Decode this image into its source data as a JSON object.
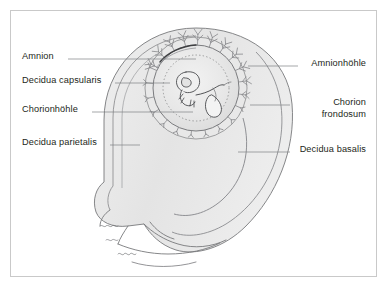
{
  "figure": {
    "type": "anatomical-diagram",
    "colors": {
      "frame_border": "#c9c9c9",
      "background": "#ffffff",
      "outline": "#6d6e71",
      "outline_light": "#8c8d8f",
      "leader_line": "#808285",
      "text": "#231f20",
      "tissue_fill": "#e9e9e9",
      "sac_fill": "#e2e2e2",
      "cavity_fill": "#ededed",
      "villi": "#8c8d8f"
    }
  },
  "labels_left": [
    {
      "text": "Amnion",
      "x": 22,
      "y": 55,
      "leader_x1": 68,
      "leader_x2": 196,
      "leader_y": 59
    },
    {
      "text": "Decidua capsularis",
      "x": 22,
      "y": 79,
      "leader_x1": 115,
      "leader_x2": 170,
      "leader_y": 83
    },
    {
      "text": "Chorionhöhle",
      "x": 22,
      "y": 108,
      "leader_x1": 92,
      "leader_x2": 193,
      "leader_y": 112
    },
    {
      "text": "Decidua parietalis",
      "x": 22,
      "y": 141,
      "leader_x1": 110,
      "leader_x2": 140,
      "leader_y": 145
    }
  ],
  "labels_right": [
    {
      "text": "Amnionhöhle",
      "x": 304,
      "y": 62,
      "leader_x1": 248,
      "leader_x2": 298,
      "leader_y": 66
    },
    {
      "text": "Chorion",
      "text2": "frondosum",
      "x": 296,
      "y": 101,
      "leader_x1": 250,
      "leader_x2": 290,
      "leader_y": 105
    },
    {
      "text": "Decidua basalis",
      "x": 296,
      "y": 148,
      "leader_x1": 238,
      "leader_x2": 290,
      "leader_y": 152
    }
  ]
}
